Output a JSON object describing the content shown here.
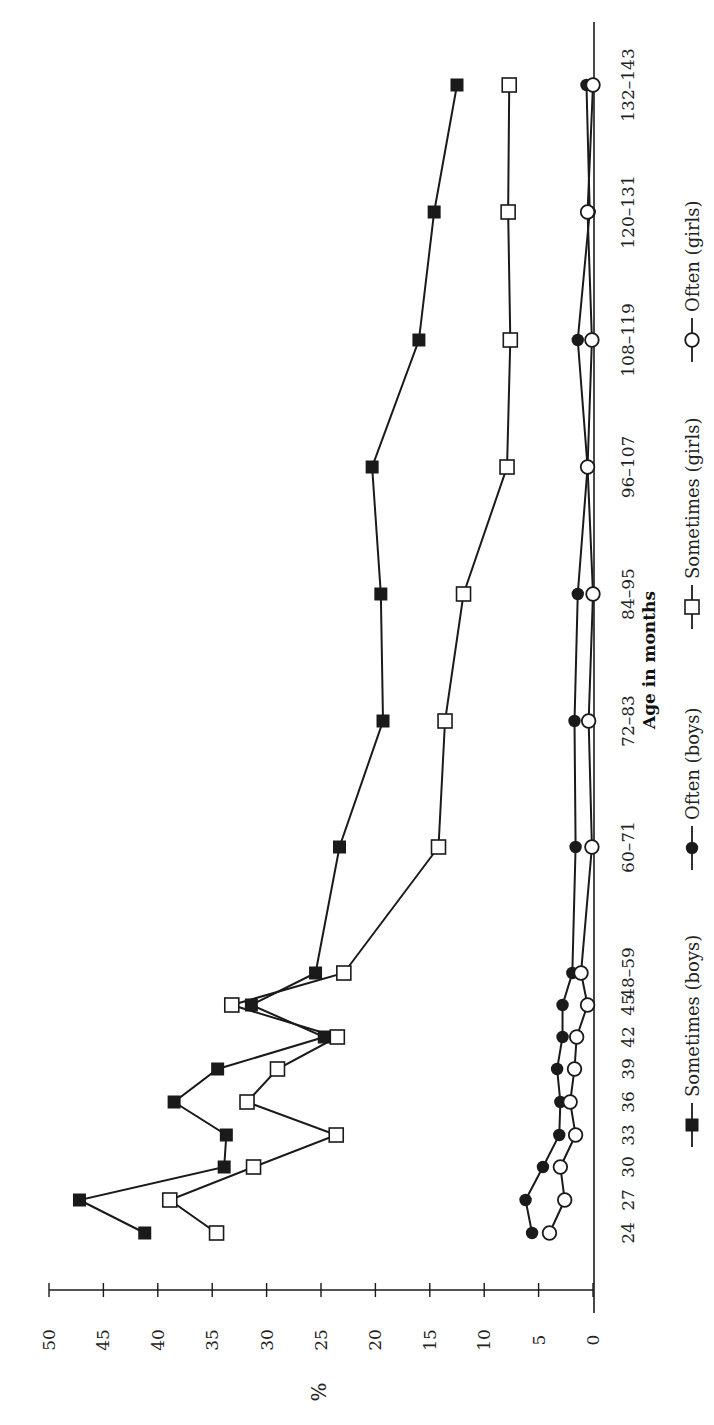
{
  "chart_data": {
    "type": "line",
    "orientation": "rotated-90-ccw",
    "title": "",
    "xlabel": "Age in months",
    "ylabel": "%",
    "ylim": [
      0,
      50
    ],
    "yticks": [
      0,
      5,
      10,
      15,
      20,
      25,
      30,
      35,
      40,
      45,
      50
    ],
    "grid": false,
    "legend_position": "bottom",
    "categories": [
      "24",
      "27",
      "30",
      "33",
      "36",
      "39",
      "42",
      "45",
      "48–59",
      "60–71",
      "72–83",
      "84–95",
      "96–107",
      "108–119",
      "120–131",
      "132–143"
    ],
    "series": [
      {
        "name": "Sometimes (boys)",
        "marker": "filled-square",
        "values": [
          41.2,
          47.2,
          33.9,
          33.7,
          38.5,
          34.5,
          24.7,
          31.4,
          25.5,
          23.3,
          19.3,
          19.5,
          20.3,
          16.0,
          14.6,
          12.5
        ]
      },
      {
        "name": "Often (boys)",
        "marker": "filled-circle",
        "values": [
          5.6,
          6.2,
          4.6,
          3.1,
          3.0,
          3.3,
          2.8,
          2.8,
          1.9,
          1.6,
          1.7,
          1.4,
          0.5,
          1.4,
          0.3,
          0.6
        ]
      },
      {
        "name": "Sometimes (girls)",
        "marker": "open-square",
        "values": [
          34.6,
          38.9,
          31.2,
          23.6,
          31.8,
          29.0,
          23.5,
          33.2,
          22.9,
          14.2,
          13.6,
          11.9,
          7.9,
          7.6,
          7.8,
          7.7
        ]
      },
      {
        "name": "Often (girls)",
        "marker": "open-circle",
        "values": [
          4.0,
          2.6,
          3.0,
          1.6,
          2.1,
          1.7,
          1.5,
          0.5,
          1.1,
          0.1,
          0.4,
          0.0,
          0.5,
          0.1,
          0.5,
          0.0
        ]
      }
    ]
  },
  "layout": {
    "category_positions": [
      1233,
      1200,
      1167,
      1135,
      1102,
      1069,
      1037,
      1005,
      973,
      847,
      721,
      594,
      467,
      340,
      212,
      85
    ],
    "value_axis": {
      "zero_px": 593,
      "max_px": 49,
      "max_value": 50,
      "line_px": 1290
    },
    "category_axis": {
      "line_px": 594,
      "top_px": 22,
      "bottom_px": 1313
    },
    "legend_positions": [
      1125,
      848,
      607,
      340
    ],
    "colors": {
      "ink": "#1a1a1a",
      "background": "#ffffff"
    }
  }
}
